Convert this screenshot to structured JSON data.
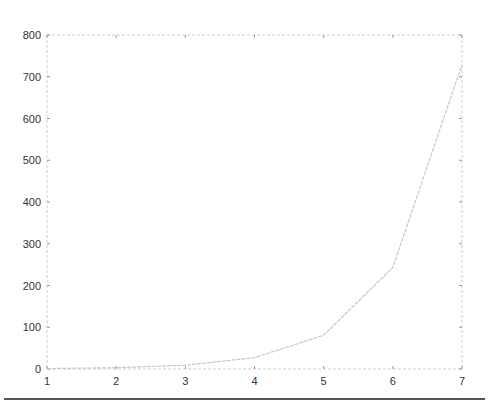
{
  "chart_data": {
    "type": "line",
    "title": "",
    "xlabel": "",
    "ylabel": "",
    "x": [
      1,
      2,
      3,
      4,
      5,
      6,
      7
    ],
    "series": [
      {
        "name": "y",
        "values": [
          1,
          3,
          9,
          27,
          81,
          243,
          729
        ],
        "color": "#c8c8c8"
      }
    ],
    "xlim": [
      1,
      7
    ],
    "ylim": [
      0,
      800
    ],
    "xticks": [
      "1",
      "2",
      "3",
      "4",
      "5",
      "6",
      "7"
    ],
    "yticks": [
      "0",
      "100",
      "200",
      "300",
      "400",
      "500",
      "600",
      "700",
      "800"
    ],
    "grid": false,
    "legend": null,
    "box": true
  },
  "colors": {
    "axis": "#cfcfcf",
    "line": "#c8c8c8",
    "text": "#333333",
    "rule": "#555555"
  }
}
